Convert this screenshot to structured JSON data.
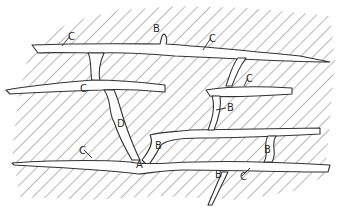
{
  "diagram": {
    "colors": {
      "background": "#ffffff",
      "hatch": "#4a4a4a",
      "outline": "#333333",
      "text": "#2b2b2b"
    },
    "labels": [
      {
        "id": "label-a",
        "text": "A",
        "x": 136,
        "y": 168
      },
      {
        "id": "label-b-top",
        "text": "B",
        "x": 153,
        "y": 32
      },
      {
        "id": "label-b-mid-right",
        "text": "B",
        "x": 227,
        "y": 111
      },
      {
        "id": "label-b-junction",
        "text": "B",
        "x": 155,
        "y": 149
      },
      {
        "id": "label-b-lower-right",
        "text": "B",
        "x": 264,
        "y": 153
      },
      {
        "id": "label-b-bottom",
        "text": "B",
        "x": 215,
        "y": 178
      },
      {
        "id": "label-c-top-left",
        "text": "C",
        "x": 68,
        "y": 40
      },
      {
        "id": "label-c-top-right",
        "text": "C",
        "x": 209,
        "y": 42
      },
      {
        "id": "label-c-second-left",
        "text": "C",
        "x": 80,
        "y": 92
      },
      {
        "id": "label-c-mid-right",
        "text": "C",
        "x": 246,
        "y": 82
      },
      {
        "id": "label-c-bottom-left",
        "text": "C",
        "x": 79,
        "y": 154
      },
      {
        "id": "label-c-bottom-right",
        "text": "C",
        "x": 240,
        "y": 180
      },
      {
        "id": "label-d",
        "text": "D",
        "x": 117,
        "y": 127
      }
    ]
  }
}
